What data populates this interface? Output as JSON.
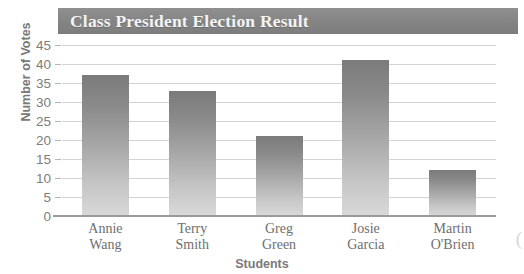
{
  "chart_data": {
    "type": "bar",
    "title": "Class President Election Result",
    "xlabel": "Students",
    "ylabel": "Number of Votes",
    "categories": [
      "Annie Wang",
      "Terry Smith",
      "Greg Green",
      "Josie Garcia",
      "Martin O'Brien"
    ],
    "category_lines": [
      [
        "Annie",
        "Wang"
      ],
      [
        "Terry",
        "Smith"
      ],
      [
        "Greg",
        "Green"
      ],
      [
        "Josie",
        "Garcia"
      ],
      [
        "Martin",
        "O'Brien"
      ]
    ],
    "values": [
      37,
      33,
      21,
      41,
      12
    ],
    "ylim": [
      0,
      45
    ],
    "ytick_labels": [
      "45",
      "40",
      "35",
      "30",
      "25",
      "20",
      "15",
      "10",
      "5",
      "0"
    ],
    "ytick_values": [
      45,
      40,
      35,
      30,
      25,
      20,
      15,
      10,
      5,
      0
    ],
    "grid": true,
    "legend": "none",
    "colors": {
      "banner": "#848484",
      "title_text": "#f4f4f4",
      "bar_top": "#7b7b7b",
      "bar_bottom": "#d9d9d9",
      "gridline": "#d3d3d3",
      "axis": "#9a9a9a",
      "tick_text": "#7d7d7d"
    }
  },
  "edge_glyph": "("
}
